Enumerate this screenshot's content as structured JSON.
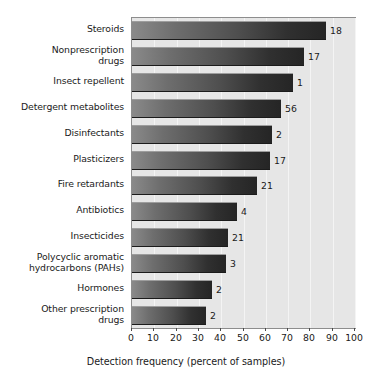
{
  "chart_data": {
    "type": "bar",
    "orientation": "horizontal",
    "title": "",
    "xlabel": "Detection frequency (percent of samples)",
    "ylabel": "",
    "xlim": [
      0,
      100
    ],
    "xticks": [
      0,
      10,
      20,
      30,
      40,
      50,
      60,
      70,
      80,
      90,
      100
    ],
    "grid": true,
    "legend": null,
    "categories": [
      "Steroids",
      "Nonprescription\ndrugs",
      "Insect repellent",
      "Detergent metabolites",
      "Disinfectants",
      "Plasticizers",
      "Fire retardants",
      "Antibiotics",
      "Insecticides",
      "Polycyclic aromatic\nhydrocarbons (PAHs)",
      "Hormones",
      "Other prescription\ndrugs"
    ],
    "values": [
      87,
      77,
      72,
      67,
      63,
      62,
      56,
      47,
      43,
      42,
      36,
      33
    ],
    "annotations": [
      "18",
      "17",
      "1",
      "56",
      "2",
      "17",
      "21",
      "4",
      "21",
      "3",
      "2",
      "2"
    ]
  },
  "axis": {
    "tick_labels": [
      "0",
      "10",
      "20",
      "30",
      "40",
      "50",
      "60",
      "70",
      "80",
      "90",
      "100"
    ],
    "title": "Detection frequency (percent of samples)"
  },
  "style": {
    "plot_background": "#e6e6e6",
    "gridline_color": "#f4f4f4",
    "bar_gradient_start": "#8a8a8a",
    "bar_gradient_end": "#252525",
    "text_color": "#1a1a1a",
    "border_color": "#8d8d8d"
  }
}
